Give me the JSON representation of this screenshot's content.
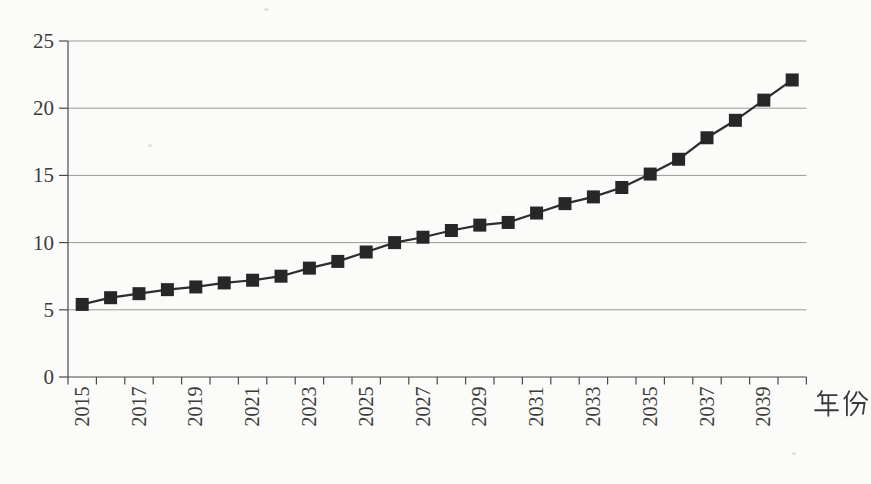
{
  "figure": {
    "background": "#fbfbf9",
    "title": ""
  },
  "chart_data": {
    "type": "line",
    "title": "",
    "xlabel": "年份",
    "ylabel": "",
    "x": [
      2015,
      2016,
      2017,
      2018,
      2019,
      2020,
      2021,
      2022,
      2023,
      2024,
      2025,
      2026,
      2027,
      2028,
      2029,
      2030,
      2031,
      2032,
      2033,
      2034,
      2035,
      2036,
      2037,
      2038,
      2039,
      2040
    ],
    "values": [
      5.4,
      5.9,
      6.2,
      6.5,
      6.7,
      7.0,
      7.2,
      7.5,
      8.1,
      8.6,
      9.3,
      10.0,
      10.4,
      10.9,
      11.3,
      11.5,
      12.2,
      12.9,
      13.4,
      14.1,
      15.1,
      16.2,
      17.8,
      19.1,
      20.6,
      22.1
    ],
    "ylim": [
      0,
      25
    ],
    "yticks": [
      0,
      5,
      10,
      15,
      20,
      25
    ],
    "ytick_labels": [
      "0",
      "5",
      "10",
      "15",
      "20",
      "25"
    ],
    "xtick_labels": [
      "2015",
      "2017",
      "2019",
      "2021",
      "2023",
      "2025",
      "2027",
      "2029",
      "2031",
      "2033",
      "2035",
      "2037",
      "2039"
    ],
    "xtick_label_every": 2,
    "xtick_rotation_deg": -90,
    "grid": "horizontal",
    "legend": "none",
    "marker": "square",
    "colors": {
      "line": "#2d2d2d",
      "marker": "#272727",
      "grid": "#9a9a98",
      "axis": "#4a4a4a",
      "text": "#3b3b3b"
    }
  }
}
